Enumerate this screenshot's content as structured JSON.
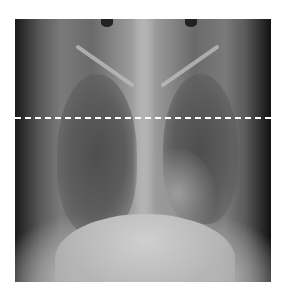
{
  "image": {
    "subject": "chest-xray-frontal",
    "annotation": "horizontal dashed line",
    "colors": {
      "background": "#ffffff",
      "dash": "#ffffff"
    }
  }
}
